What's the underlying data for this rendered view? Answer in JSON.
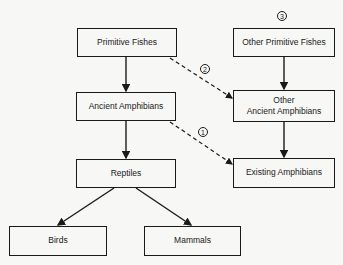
{
  "diagram": {
    "nodes": {
      "primitive_fishes": "Primitive Fishes",
      "other_primitive_fishes": "Other Primitive Fishes",
      "ancient_amphibians": "Ancient Amphibians",
      "other_ancient_amphibians_line1": "Other",
      "other_ancient_amphibians_line2": "Ancient Amphibians",
      "reptiles": "Reptiles",
      "existing_amphibians": "Existing Amphibians",
      "birds": "Birds",
      "mammals": "Mammals"
    },
    "badges": {
      "one": "1",
      "two": "2",
      "three": "3"
    },
    "edges": [
      {
        "from": "Primitive Fishes",
        "to": "Ancient Amphibians",
        "style": "solid"
      },
      {
        "from": "Primitive Fishes",
        "to": "Other Ancient Amphibians",
        "style": "dashed",
        "label": "2"
      },
      {
        "from": "Other Primitive Fishes",
        "to": "Other Ancient Amphibians",
        "style": "solid"
      },
      {
        "from": "Ancient Amphibians",
        "to": "Reptiles",
        "style": "solid"
      },
      {
        "from": "Ancient Amphibians",
        "to": "Existing Amphibians",
        "style": "dashed",
        "label": "1"
      },
      {
        "from": "Other Ancient Amphibians",
        "to": "Existing Amphibians",
        "style": "solid"
      },
      {
        "from": "Reptiles",
        "to": "Birds",
        "style": "solid"
      },
      {
        "from": "Reptiles",
        "to": "Mammals",
        "style": "solid"
      }
    ]
  }
}
